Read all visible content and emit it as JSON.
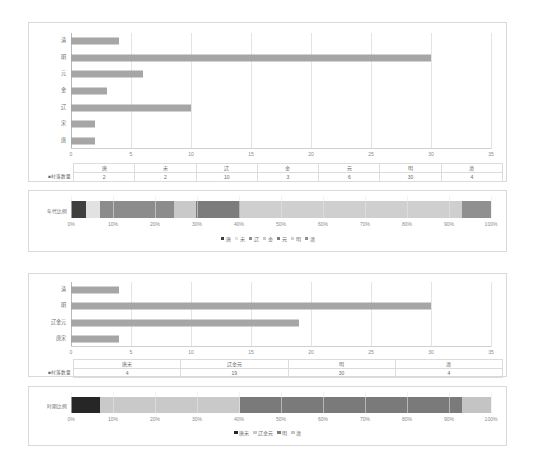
{
  "chart_data": [
    {
      "type": "bar",
      "title": "",
      "orientation": "horizontal",
      "categories": [
        "清",
        "明",
        "元",
        "金",
        "辽",
        "宋",
        "唐"
      ],
      "values": [
        4,
        30,
        6,
        3,
        10,
        2,
        2
      ],
      "xlabel": "",
      "ylabel": "",
      "xlim": [
        0,
        35
      ],
      "xticks": [
        "0",
        "5",
        "10",
        "15",
        "20",
        "25",
        "30",
        "35"
      ],
      "grid": true,
      "bar_color": "#a6a6a6"
    },
    {
      "type": "table",
      "row_label": "■村落数量",
      "columns": [
        "唐",
        "宋",
        "辽",
        "金",
        "元",
        "明",
        "清"
      ],
      "values": [
        "2",
        "2",
        "10",
        "3",
        "6",
        "30",
        "4"
      ]
    },
    {
      "type": "bar",
      "subtype": "stacked-100",
      "ylabel": "年代比例",
      "categories": [
        "年代比例"
      ],
      "series": [
        {
          "name": "唐",
          "values": [
            3.51
          ],
          "color": "#3f3f3f"
        },
        {
          "name": "宋",
          "values": [
            3.51
          ],
          "color": "#e2e2e2"
        },
        {
          "name": "辽",
          "values": [
            17.54
          ],
          "color": "#8c8c8c"
        },
        {
          "name": "金",
          "values": [
            5.26
          ],
          "color": "#c9c9c9"
        },
        {
          "name": "元",
          "values": [
            10.53
          ],
          "color": "#7c7c7c"
        },
        {
          "name": "明",
          "values": [
            52.63
          ],
          "color": "#cfcfcf"
        },
        {
          "name": "清",
          "values": [
            7.02
          ],
          "color": "#909090"
        }
      ],
      "xticks": [
        "0%",
        "10%",
        "20%",
        "30%",
        "40%",
        "50%",
        "60%",
        "70%",
        "80%",
        "90%",
        "100%"
      ],
      "xlim": [
        0,
        100
      ],
      "legend_position": "bottom"
    },
    {
      "type": "bar",
      "orientation": "horizontal",
      "categories": [
        "清",
        "明",
        "辽金元",
        "唐宋"
      ],
      "values": [
        4,
        30,
        19,
        4
      ],
      "xlim": [
        0,
        35
      ],
      "xticks": [
        "0",
        "5",
        "10",
        "15",
        "20",
        "25",
        "30",
        "35"
      ],
      "grid": true,
      "bar_color": "#a6a6a6"
    },
    {
      "type": "table",
      "row_label": "■村落数量",
      "columns": [
        "唐宋",
        "辽金元",
        "明",
        "清"
      ],
      "values": [
        "4",
        "19",
        "30",
        "4"
      ]
    },
    {
      "type": "bar",
      "subtype": "stacked-100",
      "ylabel": "时期比例",
      "categories": [
        "时期比例"
      ],
      "series": [
        {
          "name": "唐宋",
          "values": [
            7.02
          ],
          "color": "#262626"
        },
        {
          "name": "辽金元",
          "values": [
            33.33
          ],
          "color": "#c9c9c9"
        },
        {
          "name": "明",
          "values": [
            52.63
          ],
          "color": "#7a7a7a"
        },
        {
          "name": "清",
          "values": [
            7.02
          ],
          "color": "#c4c4c4"
        }
      ],
      "xticks": [
        "0%",
        "10%",
        "20%",
        "30%",
        "40%",
        "50%",
        "60%",
        "70%",
        "80%",
        "90%",
        "100%"
      ],
      "xlim": [
        0,
        100
      ],
      "legend_position": "bottom"
    }
  ],
  "chart1": {
    "categories": [
      "清",
      "明",
      "元",
      "金",
      "辽",
      "宋",
      "唐"
    ],
    "values": [
      4,
      30,
      6,
      3,
      10,
      2,
      2
    ],
    "xticks": [
      "0",
      "5",
      "10",
      "15",
      "20",
      "25",
      "30",
      "35"
    ],
    "table": {
      "row_label": "■村落数量",
      "columns": [
        "唐",
        "宋",
        "辽",
        "金",
        "元",
        "明",
        "清"
      ],
      "values": [
        "2",
        "2",
        "10",
        "3",
        "6",
        "30",
        "4"
      ]
    }
  },
  "stack1": {
    "label": "年代比例",
    "xticks": [
      "0%",
      "10%",
      "20%",
      "30%",
      "40%",
      "50%",
      "60%",
      "70%",
      "80%",
      "90%",
      "100%"
    ],
    "legend": [
      "唐",
      "宋",
      "辽",
      "金",
      "元",
      "明",
      "清"
    ]
  },
  "chart2": {
    "categories": [
      "清",
      "明",
      "辽金元",
      "唐宋"
    ],
    "values": [
      4,
      30,
      19,
      4
    ],
    "xticks": [
      "0",
      "5",
      "10",
      "15",
      "20",
      "25",
      "30",
      "35"
    ],
    "table": {
      "row_label": "■村落数量",
      "columns": [
        "唐宋",
        "辽金元",
        "明",
        "清"
      ],
      "values": [
        "4",
        "19",
        "30",
        "4"
      ]
    }
  },
  "stack2": {
    "label": "时期比例",
    "xticks": [
      "0%",
      "10%",
      "20%",
      "30%",
      "40%",
      "50%",
      "60%",
      "70%",
      "80%",
      "90%",
      "100%"
    ],
    "legend": [
      "唐宋",
      "辽金元",
      "明",
      "清"
    ]
  }
}
